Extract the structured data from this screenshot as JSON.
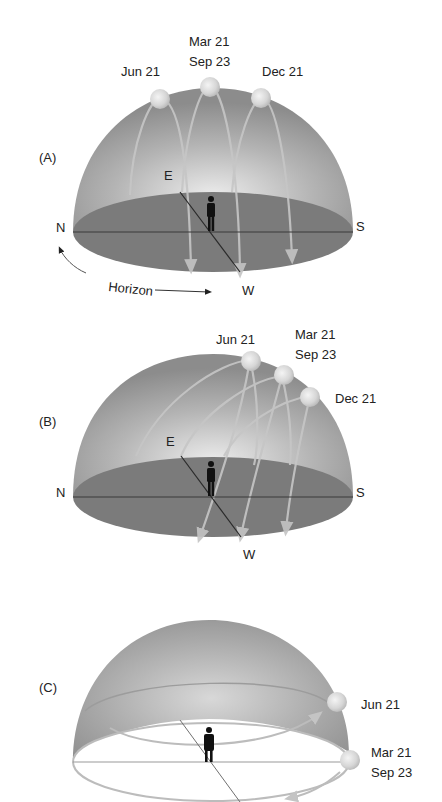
{
  "colors": {
    "dome_dark": "#8e8e8e",
    "dome_light": "#e2e2e2",
    "floor": "#7a7a7a",
    "path": "#c4c4c4",
    "sun": "#dcdcdc",
    "figure": "#111111",
    "text": "#222222"
  },
  "panels": [
    {
      "id": "A",
      "label": "(A)",
      "directions": {
        "north": "N",
        "south": "S",
        "east": "E",
        "west": "W"
      },
      "horizon_label": "Horizon",
      "suns": [
        {
          "label": "Jun 21"
        },
        {
          "label_line1": "Mar 21",
          "label_line2": "Sep 23"
        },
        {
          "label": "Dec 21"
        }
      ]
    },
    {
      "id": "B",
      "label": "(B)",
      "directions": {
        "north": "N",
        "south": "S",
        "east": "E",
        "west": "W"
      },
      "suns": [
        {
          "label": "Jun 21"
        },
        {
          "label_line1": "Mar 21",
          "label_line2": "Sep 23"
        },
        {
          "label": "Dec 21"
        }
      ]
    },
    {
      "id": "C",
      "label": "(C)",
      "suns": [
        {
          "label": "Jun 21"
        },
        {
          "label_line1": "Mar 21",
          "label_line2": "Sep 23"
        }
      ]
    }
  ]
}
